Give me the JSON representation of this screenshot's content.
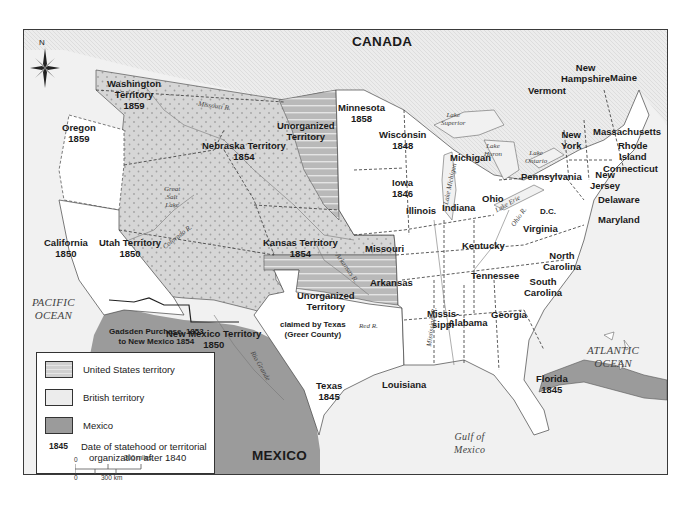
{
  "map": {
    "title_region": "CANADA",
    "southern_region": "MEXICO",
    "compass_label": "N",
    "colors": {
      "us_territory": "#d4d4d4",
      "us_territory_dots": "#a8a8a8",
      "british_territory": "#ececec",
      "mexico": "#9a9a9a",
      "states": "#ffffff",
      "water": "#f1f1f1",
      "unorganized_stripes": "#b8b8b8",
      "border": "#333333"
    },
    "regions": [
      {
        "name": "Washington Territory",
        "year": "1859",
        "type": "us_territory"
      },
      {
        "name": "Oregon",
        "year": "1859",
        "type": "state"
      },
      {
        "name": "California",
        "year": "1850",
        "type": "state"
      },
      {
        "name": "Utah Territory",
        "year": "1850",
        "type": "us_territory"
      },
      {
        "name": "New Mexico Territory",
        "year": "1850",
        "type": "us_territory"
      },
      {
        "name": "Nebraska Territory",
        "year": "1854",
        "type": "us_territory"
      },
      {
        "name": "Kansas Territory",
        "year": "1854",
        "type": "us_territory"
      },
      {
        "name": "Unorganized Territory",
        "year": "",
        "type": "unorganized",
        "location": "north"
      },
      {
        "name": "Unorganized Territory",
        "year": "",
        "type": "unorganized",
        "location": "south"
      },
      {
        "name": "Minnesota",
        "year": "1858",
        "type": "state"
      },
      {
        "name": "Wisconsin",
        "year": "1848",
        "type": "state"
      },
      {
        "name": "Iowa",
        "year": "1846",
        "type": "state"
      },
      {
        "name": "Texas",
        "year": "1845",
        "type": "state"
      },
      {
        "name": "Florida",
        "year": "1845",
        "type": "state"
      },
      {
        "name": "Michigan",
        "year": "",
        "type": "state"
      },
      {
        "name": "Illinois",
        "year": "",
        "type": "state"
      },
      {
        "name": "Indiana",
        "year": "",
        "type": "state"
      },
      {
        "name": "Ohio",
        "year": "",
        "type": "state"
      },
      {
        "name": "Missouri",
        "year": "",
        "type": "state"
      },
      {
        "name": "Kentucky",
        "year": "",
        "type": "state"
      },
      {
        "name": "Tennessee",
        "year": "",
        "type": "state"
      },
      {
        "name": "Arkansas",
        "year": "",
        "type": "state"
      },
      {
        "name": "Louisiana",
        "year": "",
        "type": "state"
      },
      {
        "name": "Mississippi",
        "label": "Missis-\nsippi",
        "year": "",
        "type": "state"
      },
      {
        "name": "Alabama",
        "year": "",
        "type": "state"
      },
      {
        "name": "Georgia",
        "year": "",
        "type": "state"
      },
      {
        "name": "South Carolina",
        "year": "",
        "type": "state"
      },
      {
        "name": "North Carolina",
        "year": "",
        "type": "state"
      },
      {
        "name": "Virginia",
        "year": "",
        "type": "state"
      },
      {
        "name": "D.C.",
        "year": "",
        "type": "state"
      },
      {
        "name": "Maryland",
        "year": "",
        "type": "state"
      },
      {
        "name": "Delaware",
        "year": "",
        "type": "state"
      },
      {
        "name": "New Jersey",
        "year": "",
        "type": "state"
      },
      {
        "name": "Pennsylvania",
        "year": "",
        "type": "state"
      },
      {
        "name": "New York",
        "year": "",
        "type": "state"
      },
      {
        "name": "Connecticut",
        "year": "",
        "type": "state"
      },
      {
        "name": "Rhode Island",
        "year": "",
        "type": "state"
      },
      {
        "name": "Massachusetts",
        "year": "",
        "type": "state"
      },
      {
        "name": "Vermont",
        "year": "",
        "type": "state"
      },
      {
        "name": "New Hampshire",
        "year": "",
        "type": "state"
      },
      {
        "name": "Maine",
        "year": "",
        "type": "state"
      }
    ],
    "labels": {
      "washington": [
        "Washington",
        "Territory",
        "1859"
      ],
      "oregon": [
        "Oregon",
        "1859"
      ],
      "california": [
        "California",
        "1850"
      ],
      "utah": [
        "Utah Territory",
        "1850"
      ],
      "new_mexico": [
        "New Mexico Territory",
        "1850"
      ],
      "nebraska": [
        "Nebraska Territory",
        "1854"
      ],
      "kansas": [
        "Kansas Territory",
        "1854"
      ],
      "unorg_north": [
        "Unorganized",
        "Territory"
      ],
      "unorg_south": [
        "Unorganized",
        "Territory"
      ],
      "minnesota": [
        "Minnesota",
        "1858"
      ],
      "wisconsin": [
        "Wisconsin",
        "1848"
      ],
      "iowa": [
        "Iowa",
        "1846"
      ],
      "texas": [
        "Texas",
        "1845"
      ],
      "florida": [
        "Florida",
        "1845"
      ],
      "michigan": "Michigan",
      "illinois": "Illinois",
      "indiana": "Indiana",
      "ohio": "Ohio",
      "missouri": "Missouri",
      "kentucky": "Kentucky",
      "tennessee": "Tennessee",
      "arkansas": "Arkansas",
      "louisiana": "Louisiana",
      "mississippi": [
        "Missis-",
        "sippi"
      ],
      "alabama": "Alabama",
      "georgia": "Georgia",
      "south_carolina": [
        "South",
        "Carolina"
      ],
      "north_carolina": [
        "North",
        "Carolina"
      ],
      "virginia": "Virginia",
      "dc": "D.C.",
      "maryland": "Maryland",
      "delaware": "Delaware",
      "new_jersey": [
        "New",
        "Jersey"
      ],
      "pennsylvania": "Pennsylvania",
      "new_york": [
        "New",
        "York"
      ],
      "connecticut": "Connecticut",
      "rhode_island": [
        "Rhode",
        "Island"
      ],
      "massachusetts": "Massachusetts",
      "vermont": "Vermont",
      "new_hampshire": [
        "New",
        "Hampshire"
      ],
      "maine": "Maine",
      "gadsden": [
        "Gadsden Purchase, 1853",
        "to New Mexico 1854"
      ],
      "greer": [
        "claimed by Texas",
        "(Greer County)"
      ]
    },
    "water_labels": {
      "pacific": [
        "PACIFIC",
        "OCEAN"
      ],
      "atlantic": [
        "ATLANTIC",
        "OCEAN"
      ],
      "gulf": [
        "Gulf of",
        "Mexico"
      ],
      "lake_superior": [
        "Lake",
        "Superior"
      ],
      "lake_michigan": "Lake Michigan",
      "lake_huron": [
        "Lake",
        "Huron"
      ],
      "lake_erie": "Lake Erie",
      "lake_ontario": [
        "Lake",
        "Ontario"
      ],
      "great_salt_lake": [
        "Great",
        "Salt",
        "Lake"
      ]
    },
    "rivers": {
      "missouri": "Missouri R.",
      "colorado": "Colorado R.",
      "arkansas": "Arkansas R.",
      "red": "Red R.",
      "mississippi": "Mississippi R.",
      "ohio": "Ohio R.",
      "rio_grande": "Rio Grande"
    }
  },
  "legend": {
    "items": [
      {
        "key": "us_territory",
        "label": "United States territory"
      },
      {
        "key": "british_territory",
        "label": "British territory"
      },
      {
        "key": "mexico",
        "label": "Mexico"
      }
    ],
    "date_example": "1845",
    "date_label": [
      "Date of statehood or territorial",
      "organization after 1840"
    ],
    "scale": {
      "miles_zero": "0",
      "miles_label": "300 miles",
      "km_zero": "0",
      "km_label": "300 km"
    }
  }
}
